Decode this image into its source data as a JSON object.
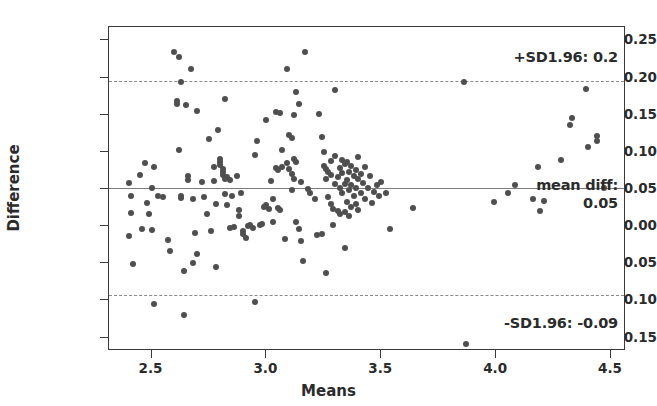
{
  "chart_data": {
    "type": "scatter",
    "title": "",
    "xlabel": "Means",
    "ylabel": "Difference",
    "xlim": [
      2.315,
      4.565
    ],
    "ylim": [
      -0.168,
      0.268
    ],
    "xticks": [
      "2.5",
      "3.0",
      "3.5",
      "4.0",
      "4.5"
    ],
    "xtick_values": [
      2.5,
      3.0,
      3.5,
      4.0,
      4.5
    ],
    "yticks": [
      "0.25",
      "0.20",
      "0.15",
      "0.10",
      "0.05",
      "0.00",
      "-0.05",
      "-0.10",
      "-0.15"
    ],
    "ytick_values": [
      0.25,
      0.2,
      0.15,
      0.1,
      0.05,
      0.0,
      -0.05,
      -0.1,
      -0.15
    ],
    "grid": false,
    "legend": "none",
    "point_color": "#4f4f4f",
    "line_color": "#7b7b7b",
    "reference_lines": [
      {
        "name": "upper-loa",
        "value": 0.196,
        "style": "dashed",
        "label": "+SD1.96: 0.2"
      },
      {
        "name": "mean-diff",
        "value": 0.052,
        "style": "solid",
        "label": "mean diff:",
        "value_label": "0.05"
      },
      {
        "name": "lower-loa",
        "value": -0.092,
        "style": "dashed",
        "label": "-SD1.96: -0.09"
      }
    ],
    "annotations": {
      "upper": "+SD1.96: 0.2",
      "mean": "mean diff:",
      "mean_value": "0.05",
      "lower": "-SD1.96: -0.09"
    },
    "n_points": 201,
    "points": [
      [
        2.4,
        0.058
      ],
      [
        2.4,
        -0.013
      ],
      [
        2.41,
        0.04
      ],
      [
        2.41,
        0.018
      ],
      [
        2.42,
        -0.051
      ],
      [
        2.45,
        0.069
      ],
      [
        2.46,
        -0.004
      ],
      [
        2.47,
        0.085
      ],
      [
        2.48,
        0.031
      ],
      [
        2.49,
        0.017
      ],
      [
        2.5,
        0.052
      ],
      [
        2.5,
        -0.005
      ],
      [
        2.51,
        0.079
      ],
      [
        2.51,
        -0.105
      ],
      [
        2.53,
        0.04
      ],
      [
        2.55,
        0.039
      ],
      [
        2.57,
        -0.019
      ],
      [
        2.58,
        -0.033
      ],
      [
        2.6,
        0.235
      ],
      [
        2.61,
        0.168
      ],
      [
        2.61,
        0.164
      ],
      [
        2.62,
        0.227
      ],
      [
        2.62,
        0.102
      ],
      [
        2.63,
        0.194
      ],
      [
        2.63,
        0.04
      ],
      [
        2.63,
        0.038
      ],
      [
        2.64,
        -0.061
      ],
      [
        2.64,
        -0.119
      ],
      [
        2.65,
        0.163
      ],
      [
        2.66,
        0.068
      ],
      [
        2.66,
        0.062
      ],
      [
        2.67,
        0.212
      ],
      [
        2.68,
        0.036
      ],
      [
        2.68,
        -0.05
      ],
      [
        2.69,
        -0.009
      ],
      [
        2.7,
        0.155
      ],
      [
        2.7,
        -0.037
      ],
      [
        2.72,
        0.06
      ],
      [
        2.73,
        0.039
      ],
      [
        2.74,
        0.016
      ],
      [
        2.75,
        0.117
      ],
      [
        2.76,
        -0.006
      ],
      [
        2.77,
        0.08
      ],
      [
        2.77,
        0.061
      ],
      [
        2.78,
        0.03
      ],
      [
        2.78,
        -0.055
      ],
      [
        2.79,
        0.129
      ],
      [
        2.8,
        0.09
      ],
      [
        2.8,
        0.086
      ],
      [
        2.8,
        0.082
      ],
      [
        2.81,
        0.077
      ],
      [
        2.81,
        0.073
      ],
      [
        2.81,
        0.069
      ],
      [
        2.82,
        0.064
      ],
      [
        2.82,
        0.171
      ],
      [
        2.82,
        0.043
      ],
      [
        2.83,
        0.066
      ],
      [
        2.83,
        0.029
      ],
      [
        2.84,
        0.062
      ],
      [
        2.84,
        -0.003
      ],
      [
        2.85,
        0.04
      ],
      [
        2.86,
        -0.001
      ],
      [
        2.87,
        0.067
      ],
      [
        2.88,
        0.022
      ],
      [
        2.88,
        0.013
      ],
      [
        2.89,
        0.044
      ],
      [
        2.9,
        -0.006
      ],
      [
        2.9,
        -0.011
      ],
      [
        2.91,
        -0.016
      ],
      [
        2.92,
        0.0
      ],
      [
        2.93,
        0.001
      ],
      [
        2.94,
        -0.003
      ],
      [
        2.95,
        0.096
      ],
      [
        2.95,
        -0.102
      ],
      [
        2.96,
        0.115
      ],
      [
        2.97,
        0.002
      ],
      [
        2.98,
        0.003
      ],
      [
        2.99,
        0.026
      ],
      [
        3.0,
        0.143
      ],
      [
        3.0,
        0.028
      ],
      [
        3.01,
        0.023
      ],
      [
        3.02,
        0.061
      ],
      [
        3.03,
        0.036
      ],
      [
        3.03,
        0.005
      ],
      [
        3.04,
        0.153
      ],
      [
        3.04,
        0.078
      ],
      [
        3.05,
        0.075
      ],
      [
        3.05,
        0.025
      ],
      [
        3.06,
        0.152
      ],
      [
        3.06,
        0.022
      ],
      [
        3.07,
        0.08
      ],
      [
        3.07,
        0.103
      ],
      [
        3.08,
        -0.017
      ],
      [
        3.09,
        0.212
      ],
      [
        3.09,
        0.085
      ],
      [
        3.1,
        0.123
      ],
      [
        3.1,
        0.077
      ],
      [
        3.11,
        0.119
      ],
      [
        3.11,
        0.07
      ],
      [
        3.11,
        0.049
      ],
      [
        3.12,
        0.149
      ],
      [
        3.12,
        0.09
      ],
      [
        3.12,
        0.063
      ],
      [
        3.13,
        0.181
      ],
      [
        3.13,
        0.087
      ],
      [
        3.13,
        0.005
      ],
      [
        3.14,
        0.165
      ],
      [
        3.14,
        -0.004
      ],
      [
        3.15,
        0.06
      ],
      [
        3.15,
        -0.02
      ],
      [
        3.16,
        -0.047
      ],
      [
        3.17,
        0.235
      ],
      [
        3.18,
        0.05
      ],
      [
        3.19,
        0.045
      ],
      [
        3.21,
        0.037
      ],
      [
        3.22,
        -0.012
      ],
      [
        3.23,
        0.151
      ],
      [
        3.24,
        0.12
      ],
      [
        3.24,
        -0.01
      ],
      [
        3.25,
        0.1
      ],
      [
        3.25,
        0.081
      ],
      [
        3.26,
        0.077
      ],
      [
        3.26,
        0.064
      ],
      [
        3.26,
        -0.063
      ],
      [
        3.27,
        0.073
      ],
      [
        3.27,
        0.039
      ],
      [
        3.28,
        0.088
      ],
      [
        3.28,
        0.069
      ],
      [
        3.28,
        0.03
      ],
      [
        3.29,
        0.002
      ],
      [
        3.29,
        0.023
      ],
      [
        3.3,
        0.183
      ],
      [
        3.3,
        0.095
      ],
      [
        3.3,
        0.057
      ],
      [
        3.31,
        0.066
      ],
      [
        3.31,
        0.021
      ],
      [
        3.32,
        0.078
      ],
      [
        3.32,
        0.052
      ],
      [
        3.32,
        0.016
      ],
      [
        3.33,
        0.089
      ],
      [
        3.33,
        0.071
      ],
      [
        3.33,
        0.045
      ],
      [
        3.34,
        0.083
      ],
      [
        3.34,
        0.057
      ],
      [
        3.34,
        0.019
      ],
      [
        3.34,
        -0.029
      ],
      [
        3.35,
        0.086
      ],
      [
        3.35,
        0.062
      ],
      [
        3.35,
        0.033
      ],
      [
        3.36,
        0.073
      ],
      [
        3.36,
        0.049
      ],
      [
        3.36,
        0.013
      ],
      [
        3.37,
        0.081
      ],
      [
        3.37,
        0.055
      ],
      [
        3.37,
        0.026
      ],
      [
        3.38,
        0.068
      ],
      [
        3.38,
        0.04
      ],
      [
        3.39,
        0.075
      ],
      [
        3.39,
        0.051
      ],
      [
        3.39,
        0.03
      ],
      [
        3.4,
        0.093
      ],
      [
        3.4,
        0.063
      ],
      [
        3.4,
        0.022
      ],
      [
        3.41,
        0.07
      ],
      [
        3.41,
        0.044
      ],
      [
        3.42,
        0.058
      ],
      [
        3.43,
        0.079
      ],
      [
        3.43,
        0.036
      ],
      [
        3.44,
        0.052
      ],
      [
        3.45,
        0.068
      ],
      [
        3.46,
        0.031
      ],
      [
        3.47,
        0.046
      ],
      [
        3.48,
        0.056
      ],
      [
        3.49,
        0.041
      ],
      [
        3.5,
        0.06
      ],
      [
        3.52,
        0.044
      ],
      [
        3.54,
        -0.004
      ],
      [
        3.64,
        0.024
      ],
      [
        3.86,
        0.194
      ],
      [
        3.87,
        -0.159
      ],
      [
        3.99,
        0.033
      ],
      [
        4.05,
        0.045
      ],
      [
        4.08,
        0.055
      ],
      [
        4.16,
        0.036
      ],
      [
        4.18,
        0.079
      ],
      [
        4.19,
        0.02
      ],
      [
        4.21,
        0.034
      ],
      [
        4.28,
        0.089
      ],
      [
        4.32,
        0.136
      ],
      [
        4.33,
        0.145
      ],
      [
        4.39,
        0.185
      ],
      [
        4.4,
        0.107
      ],
      [
        4.44,
        0.121
      ],
      [
        4.44,
        0.115
      ],
      [
        4.47,
        0.052
      ]
    ]
  }
}
